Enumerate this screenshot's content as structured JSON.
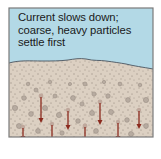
{
  "diagram": {
    "caption_lines": [
      "Current slows down;",
      "coarse, heavy particles",
      "settle first"
    ],
    "colors": {
      "water": "#b3d9e6",
      "sediment": "#dcd0c2",
      "border": "#7a7a7a",
      "boundary_line": "#4a5560",
      "arrow": "#8b2a1e",
      "particle": "#9a8e84"
    },
    "arrows": [
      {
        "x": 23,
        "y1": 127,
        "y2": 140
      },
      {
        "x": 41,
        "y1": 96,
        "y2": 122
      },
      {
        "x": 52,
        "y1": 124,
        "y2": 141
      },
      {
        "x": 68,
        "y1": 110,
        "y2": 129
      },
      {
        "x": 85,
        "y1": 126,
        "y2": 143
      },
      {
        "x": 100,
        "y1": 102,
        "y2": 124
      },
      {
        "x": 118,
        "y1": 122,
        "y2": 141
      },
      {
        "x": 139,
        "y1": 110,
        "y2": 128
      }
    ]
  }
}
